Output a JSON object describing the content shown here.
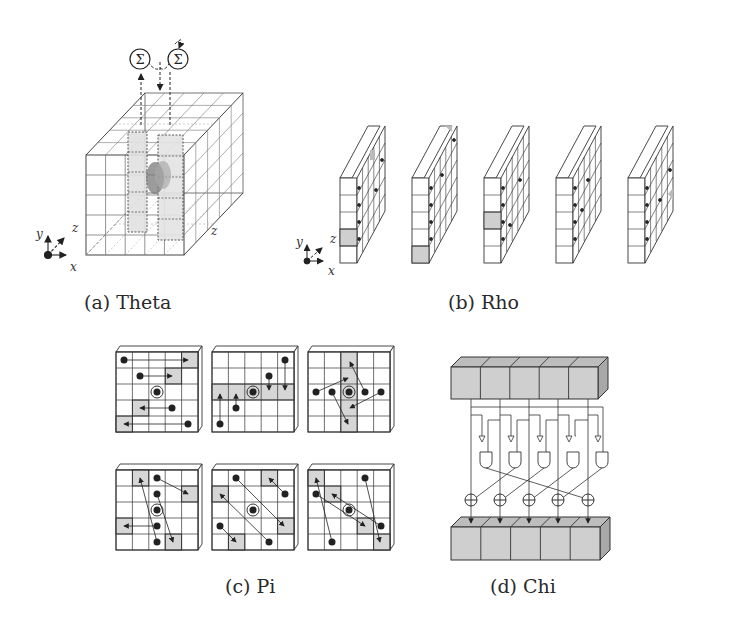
{
  "figure": {
    "panels": [
      {
        "id": "a",
        "caption": "(a)  Theta",
        "axes": {
          "x": "x",
          "y": "y",
          "z": "z"
        },
        "depth_label": "z",
        "sum_symbol": "Σ",
        "sum_nodes": 2
      },
      {
        "id": "b",
        "caption": "(b)  Rho",
        "axes": {
          "x": "x",
          "y": "y",
          "z": "z"
        },
        "slices": 5
      },
      {
        "id": "c",
        "caption": "(c)  Pi",
        "grids": 6,
        "grid_size": "5x5"
      },
      {
        "id": "d",
        "caption": "(d)  Chi",
        "lanes": 5,
        "gates": [
          "NOT",
          "AND",
          "XOR"
        ]
      }
    ]
  },
  "colors": {
    "line": "#333333",
    "shade": "#d6d6d6",
    "dark_shade": "#8a8a8a",
    "background": "#ffffff"
  }
}
